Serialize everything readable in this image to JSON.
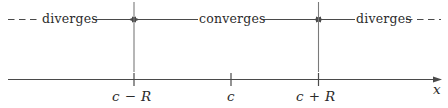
{
  "figure": {
    "colors": {
      "line": "#4a4a4a",
      "text": "#2b2b2b",
      "background": "#ffffff"
    },
    "regions": [
      {
        "id": "left",
        "label": "diverges",
        "dash_side": "left",
        "arrow_side": "right"
      },
      {
        "id": "middle",
        "label": "converges",
        "dash_side": "none",
        "arrow_side": "both"
      },
      {
        "id": "right",
        "label": "diverges",
        "dash_side": "right",
        "arrow_side": "left"
      }
    ],
    "axis": {
      "variable_label": "x",
      "ticks": [
        {
          "id": "left-endpoint",
          "label": "c − R"
        },
        {
          "id": "center",
          "label": "c"
        },
        {
          "id": "right-endpoint",
          "label": "c + R"
        }
      ]
    },
    "dividers": [
      {
        "id": "divider-left",
        "at": "c − R"
      },
      {
        "id": "divider-right",
        "at": "c + R"
      }
    ]
  }
}
